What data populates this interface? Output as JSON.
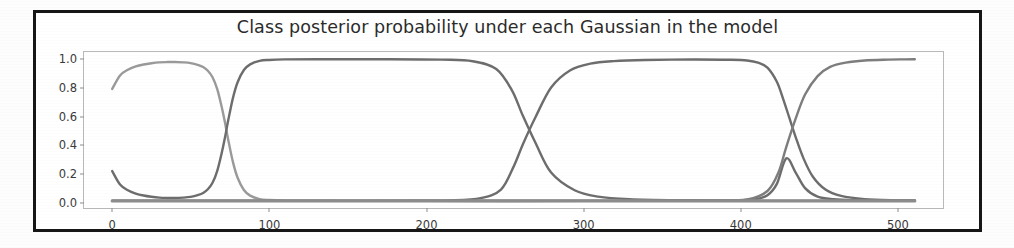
{
  "figure": {
    "title": "Class posterior probability under each Gaussian in the model"
  },
  "chart_data": {
    "type": "line",
    "title": "Class posterior probability under each Gaussian in the model",
    "xlabel": "",
    "ylabel": "",
    "xlim": [
      -18,
      530
    ],
    "ylim": [
      -0.05,
      1.05
    ],
    "grid": false,
    "legend": null,
    "xticks": [
      0,
      100,
      200,
      300,
      400,
      500
    ],
    "xtick_labels": [
      "0",
      "100",
      "200",
      "300",
      "400",
      "500"
    ],
    "yticks": [
      0.0,
      0.2,
      0.4,
      0.6,
      0.8,
      1.0
    ],
    "ytick_labels": [
      "0.0",
      "0.2",
      "0.4",
      "0.6",
      "0.8",
      "1.0"
    ],
    "series": [
      {
        "name": "gaussian-1-posterior",
        "color": "#9a9a9a",
        "linewidth": 2.4,
        "x": [
          0,
          5,
          10,
          15,
          20,
          25,
          30,
          35,
          40,
          45,
          50,
          55,
          58,
          61,
          64,
          67,
          70,
          72,
          74,
          77,
          80,
          84,
          88,
          94,
          100,
          110,
          130,
          160,
          200,
          250,
          300,
          350,
          400,
          450,
          500,
          512
        ],
        "y": [
          0.79,
          0.885,
          0.925,
          0.948,
          0.962,
          0.971,
          0.977,
          0.979,
          0.979,
          0.977,
          0.972,
          0.958,
          0.944,
          0.918,
          0.872,
          0.788,
          0.655,
          0.549,
          0.432,
          0.275,
          0.163,
          0.077,
          0.037,
          0.013,
          0.006,
          0.002,
          0.001,
          0.0,
          0.0,
          0.0,
          0.0,
          0.0,
          0.0,
          0.0,
          0.0,
          0.0
        ]
      },
      {
        "name": "gaussian-2-posterior",
        "color": "#6d6d6d",
        "linewidth": 2.4,
        "x": [
          0,
          5,
          10,
          15,
          20,
          25,
          30,
          35,
          40,
          45,
          50,
          55,
          58,
          61,
          64,
          67,
          70,
          72,
          74,
          77,
          80,
          84,
          88,
          94,
          100,
          110,
          130,
          170,
          210,
          230,
          245,
          255,
          262,
          270,
          280,
          295,
          310,
          330,
          360,
          390,
          400,
          410,
          418,
          424,
          430,
          436,
          442,
          450,
          460,
          475,
          495,
          512
        ],
        "y": [
          0.21,
          0.115,
          0.075,
          0.052,
          0.038,
          0.029,
          0.023,
          0.021,
          0.021,
          0.023,
          0.028,
          0.042,
          0.056,
          0.082,
          0.128,
          0.212,
          0.345,
          0.451,
          0.568,
          0.725,
          0.837,
          0.923,
          0.963,
          0.987,
          0.994,
          0.998,
          0.999,
          0.999,
          0.996,
          0.985,
          0.93,
          0.78,
          0.6,
          0.41,
          0.2,
          0.075,
          0.03,
          0.012,
          0.005,
          0.004,
          0.005,
          0.012,
          0.04,
          0.12,
          0.3,
          0.2,
          0.09,
          0.03,
          0.012,
          0.005,
          0.002,
          0.001
        ]
      },
      {
        "name": "gaussian-3-posterior",
        "color": "#6d6d6d",
        "linewidth": 2.4,
        "x": [
          0,
          50,
          100,
          150,
          190,
          215,
          235,
          248,
          256,
          262,
          270,
          280,
          292,
          305,
          320,
          340,
          370,
          395,
          405,
          412,
          418,
          424,
          428,
          432,
          436,
          441,
          447,
          455,
          465,
          480,
          500,
          512
        ],
        "y": [
          0.0,
          0.0,
          0.0,
          0.0,
          0.001,
          0.004,
          0.02,
          0.08,
          0.24,
          0.4,
          0.59,
          0.8,
          0.92,
          0.968,
          0.986,
          0.994,
          0.997,
          0.995,
          0.99,
          0.975,
          0.94,
          0.84,
          0.72,
          0.585,
          0.45,
          0.3,
          0.17,
          0.08,
          0.035,
          0.012,
          0.004,
          0.003
        ]
      },
      {
        "name": "gaussian-4-posterior",
        "color": "#7d7d7d",
        "linewidth": 2.4,
        "x": [
          0,
          60,
          120,
          200,
          300,
          380,
          405,
          418,
          425,
          430,
          436,
          442,
          450,
          458,
          468,
          480,
          495,
          505,
          512
        ],
        "y": [
          0.0,
          0.0,
          0.0,
          0.0,
          0.0,
          0.002,
          0.01,
          0.07,
          0.2,
          0.38,
          0.58,
          0.75,
          0.88,
          0.945,
          0.975,
          0.99,
          0.996,
          0.998,
          0.999
        ]
      },
      {
        "name": "baseline-zero-series",
        "color": "#8c8c8c",
        "linewidth": 3.2,
        "x": [
          0,
          60,
          120,
          180,
          240,
          300,
          360,
          420,
          480,
          512
        ],
        "y": [
          0.0,
          0.0,
          0.0,
          0.0,
          0.0,
          0.0,
          0.0,
          0.0,
          0.0,
          0.0
        ]
      }
    ]
  }
}
